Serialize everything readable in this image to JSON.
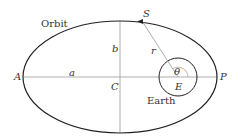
{
  "diagram": {
    "labels": {
      "orbit": "Orbit",
      "earth": "Earth",
      "A": "A",
      "P": "P",
      "C": "C",
      "E": "E",
      "S": "S",
      "a": "a",
      "b": "b",
      "r": "r",
      "theta": "θ"
    },
    "colors": {
      "ellipse": "#222222",
      "axes": "#999999",
      "text": "#333333"
    }
  }
}
